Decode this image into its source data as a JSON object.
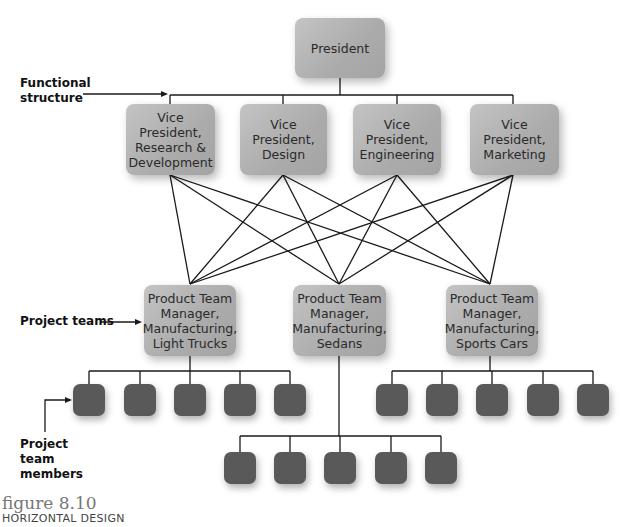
{
  "figure": {
    "number": "figure 8.10",
    "title": "HORIZONTAL DESIGN"
  },
  "annotations": {
    "functional_structure": "Functional\nstructure",
    "project_teams": "Project teams",
    "project_team_members": "Project\nteam\nmembers"
  },
  "top": {
    "president": "President"
  },
  "vice_presidents": [
    {
      "label": "Vice\nPresident,\nResearch &\nDevelopment"
    },
    {
      "label": "Vice\nPresident,\nDesign"
    },
    {
      "label": "Vice\nPresident,\nEngineering"
    },
    {
      "label": "Vice\nPresident,\nMarketing"
    }
  ],
  "product_team_managers": [
    {
      "label": "Product Team\nManager,\nManufacturing,\nLight Trucks",
      "member_count": 5
    },
    {
      "label": "Product Team\nManager,\nManufacturing,\nSedans",
      "member_count": 5
    },
    {
      "label": "Product Team\nManager,\nManufacturing,\nSports Cars",
      "member_count": 5
    }
  ],
  "colors": {
    "box_gray": "#b0b0b0",
    "member_dark": "#595959",
    "line": "#1a1a1a",
    "figure_number": "#777777"
  }
}
